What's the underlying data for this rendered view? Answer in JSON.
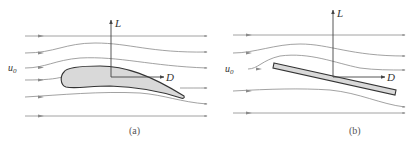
{
  "figure": {
    "panels": [
      {
        "id": "a",
        "caption": "(a)",
        "body_type": "airfoil",
        "labels": {
          "lift": "L",
          "drag": "D",
          "freestream": "u",
          "freestream_sub": "0"
        }
      },
      {
        "id": "b",
        "caption": "(b)",
        "body_type": "flat-plate",
        "labels": {
          "lift": "L",
          "drag": "D",
          "freestream": "u",
          "freestream_sub": "0"
        }
      }
    ],
    "colors": {
      "streamline": "#8a8a8a",
      "body_fill": "#d9d9d9",
      "body_stroke": "#333333",
      "axis": "#444444"
    }
  }
}
